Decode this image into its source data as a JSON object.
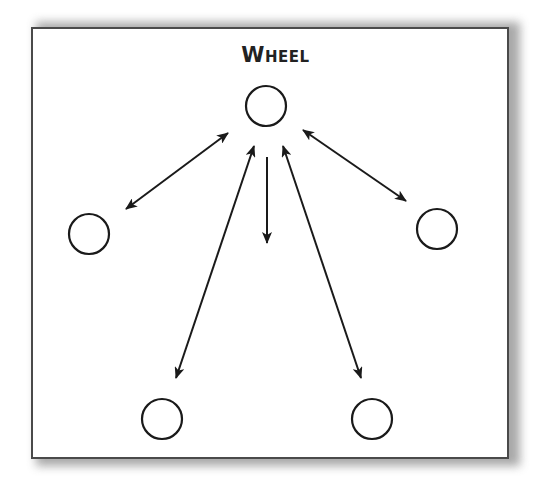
{
  "diagram": {
    "title": "Wheel",
    "line_color": "#1a1a1a",
    "border_color": "#4a4a4a",
    "nodes": [
      {
        "id": "center",
        "cx": 266,
        "cy": 106,
        "r": 20
      },
      {
        "id": "left",
        "cx": 89,
        "cy": 234,
        "r": 21
      },
      {
        "id": "right",
        "cx": 437,
        "cy": 229,
        "r": 21
      },
      {
        "id": "bottom-left",
        "cx": 162,
        "cy": 419,
        "r": 20
      },
      {
        "id": "bottom-right",
        "cx": 372,
        "cy": 419,
        "r": 20
      }
    ],
    "edges": [
      {
        "from": "center",
        "to": "left",
        "type": "bidirectional"
      },
      {
        "from": "center",
        "to": "right",
        "type": "bidirectional"
      },
      {
        "from": "center",
        "to": "bottom-left",
        "type": "bidirectional"
      },
      {
        "from": "center",
        "to": "bottom-right",
        "type": "bidirectional"
      },
      {
        "from": "center",
        "to": "down",
        "type": "one-way"
      }
    ]
  }
}
